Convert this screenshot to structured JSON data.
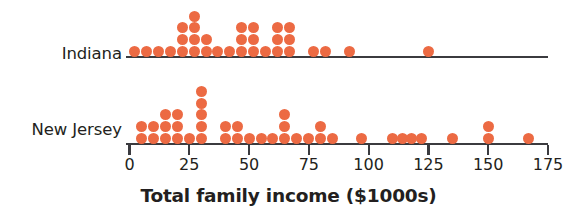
{
  "chart_data": {
    "type": "scatter",
    "plot_style": "dot-plot",
    "title": "",
    "xlabel": "Total family income ($1000s)",
    "ylabel": "",
    "xlim": [
      0,
      175
    ],
    "xticks": [
      0,
      25,
      50,
      75,
      100,
      125,
      150,
      175
    ],
    "xtick_labels": [
      "0",
      "25",
      "50",
      "75",
      "100",
      "125",
      "150",
      "175"
    ],
    "grid": false,
    "legend": false,
    "dot_color": "#ec6a43",
    "axis_color": "#3b3b3f",
    "groups": [
      {
        "name": "Indiana",
        "label": "Indiana",
        "dot_stacks": [
          {
            "value": 2,
            "count": 1
          },
          {
            "value": 7,
            "count": 1
          },
          {
            "value": 12,
            "count": 1
          },
          {
            "value": 17,
            "count": 1
          },
          {
            "value": 22,
            "count": 3
          },
          {
            "value": 27,
            "count": 4
          },
          {
            "value": 32,
            "count": 2
          },
          {
            "value": 37,
            "count": 1
          },
          {
            "value": 42,
            "count": 1
          },
          {
            "value": 47,
            "count": 3
          },
          {
            "value": 52,
            "count": 3
          },
          {
            "value": 57,
            "count": 1
          },
          {
            "value": 62,
            "count": 3
          },
          {
            "value": 67,
            "count": 3
          },
          {
            "value": 77,
            "count": 1
          },
          {
            "value": 82,
            "count": 1
          },
          {
            "value": 92,
            "count": 1
          },
          {
            "value": 125,
            "count": 1
          }
        ],
        "total_dots": 31
      },
      {
        "name": "New Jersey",
        "label": "New Jersey",
        "dot_stacks": [
          {
            "value": 5,
            "count": 2
          },
          {
            "value": 10,
            "count": 2
          },
          {
            "value": 15,
            "count": 3
          },
          {
            "value": 20,
            "count": 3
          },
          {
            "value": 25,
            "count": 1
          },
          {
            "value": 30,
            "count": 5
          },
          {
            "value": 40,
            "count": 2
          },
          {
            "value": 45,
            "count": 2
          },
          {
            "value": 50,
            "count": 1
          },
          {
            "value": 55,
            "count": 1
          },
          {
            "value": 60,
            "count": 1
          },
          {
            "value": 65,
            "count": 3
          },
          {
            "value": 70,
            "count": 1
          },
          {
            "value": 75,
            "count": 1
          },
          {
            "value": 80,
            "count": 2
          },
          {
            "value": 85,
            "count": 1
          },
          {
            "value": 97,
            "count": 1
          },
          {
            "value": 110,
            "count": 1
          },
          {
            "value": 114,
            "count": 1
          },
          {
            "value": 118,
            "count": 1
          },
          {
            "value": 122,
            "count": 1
          },
          {
            "value": 135,
            "count": 1
          },
          {
            "value": 150,
            "count": 2
          },
          {
            "value": 167,
            "count": 1
          }
        ],
        "total_dots": 40
      }
    ]
  },
  "axis": {
    "title": "Total family income ($1000s)",
    "ticks": [
      "0",
      "25",
      "50",
      "75",
      "100",
      "125",
      "150",
      "175"
    ]
  },
  "rows": {
    "indiana_label": "Indiana",
    "newjersey_label": "New Jersey"
  }
}
